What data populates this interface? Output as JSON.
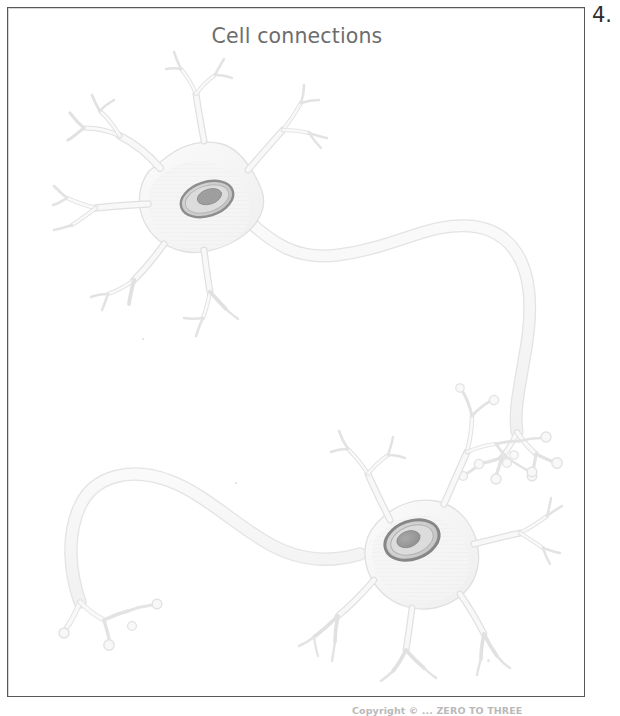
{
  "page": {
    "item_number": "4.",
    "background_color": "#ffffff",
    "frame_border_color": "#58585a"
  },
  "figure": {
    "title": "Cell connections",
    "title_color": "#6d6d6d",
    "caption_bottom": "Copyright © ... ZERO TO THREE"
  },
  "artwork": {
    "name": "two-connected-neurons-diagram",
    "palette": {
      "membrane_outline": "#e2e2e2",
      "cytoplasm_fill": "#f7f7f7",
      "soma_fill": "#f4f4f4",
      "axon_fill": "#f6f6f6",
      "nucleus_ring": "#8d8d8d",
      "nucleus_inner": "#dadada",
      "nucleolus": "#9c9c9c"
    },
    "cells": [
      {
        "id": "upper-neuron",
        "label": "upper nerve cell",
        "soma_center": {
          "x": 195,
          "y": 200
        },
        "nucleus_center": {
          "x": 207,
          "y": 199
        },
        "nucleus_rx": 27,
        "nucleus_ry": 17,
        "nucleus_rotation_deg": -18,
        "dendrite_count": 6,
        "axon_direction": "right-then-down",
        "axon_terminal_count": 6
      },
      {
        "id": "lower-neuron",
        "label": "lower nerve cell",
        "soma_center": {
          "x": 412,
          "y": 540
        },
        "nucleus_center": {
          "x": 396,
          "y": 533
        },
        "nucleus_rx": 26,
        "nucleus_ry": 18,
        "nucleus_rotation_deg": -20,
        "dendrite_count": 7,
        "axon_direction": "left-then-down",
        "axon_terminal_count": 4
      }
    ],
    "synapse_regions": [
      {
        "id": "synapse-upper-to-lower",
        "x": 520,
        "y": 455,
        "note": "upper axon terminals meet lower cell dendrites"
      }
    ]
  }
}
